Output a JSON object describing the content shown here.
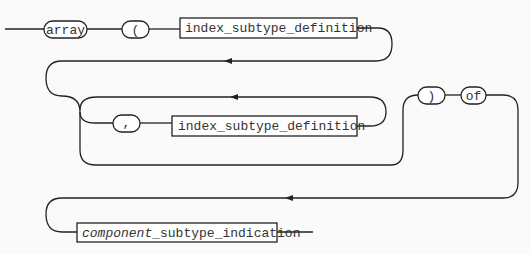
{
  "diagram": {
    "type": "railroad-syntax-diagram",
    "terminals": {
      "array": "array",
      "lparen": "(",
      "comma": ",",
      "rparen": ")",
      "of": "of"
    },
    "nonterminals": {
      "index_def_1": "index_subtype_definition",
      "index_def_2": "index_subtype_definition",
      "component_prefix": "component",
      "component_suffix": "_subtype_indication"
    },
    "sequence": [
      "array",
      "(",
      "index_subtype_definition",
      "{ , index_subtype_definition }",
      ")",
      "of",
      "component_subtype_indication"
    ]
  }
}
